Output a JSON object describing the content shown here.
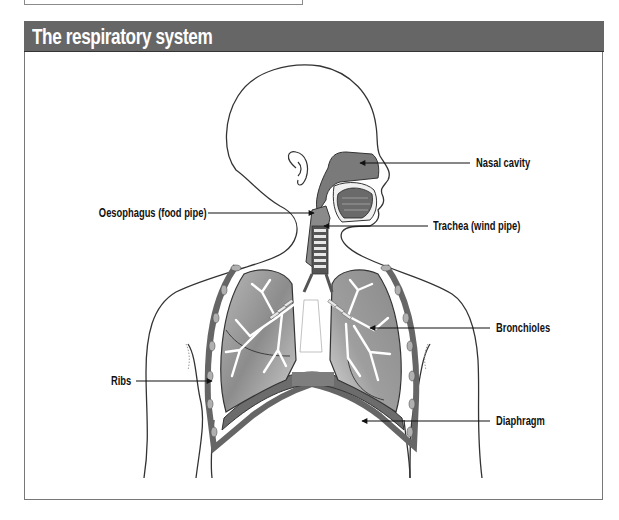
{
  "title": "The respiratory system",
  "labels": {
    "nasal_cavity": "Nasal cavity",
    "oesophagus": "Oesophagus (food pipe)",
    "trachea": "Trachea (wind pipe)",
    "bronchioles": "Bronchioles",
    "ribs": "Ribs",
    "diaphragm": "Diaphragm"
  },
  "colors": {
    "header_bg": "#666666",
    "header_text": "#ffffff",
    "organ_dark": "#6e6e6e",
    "organ_mid": "#9a9a9a",
    "organ_light": "#d0d0d0",
    "outline": "#333333"
  }
}
